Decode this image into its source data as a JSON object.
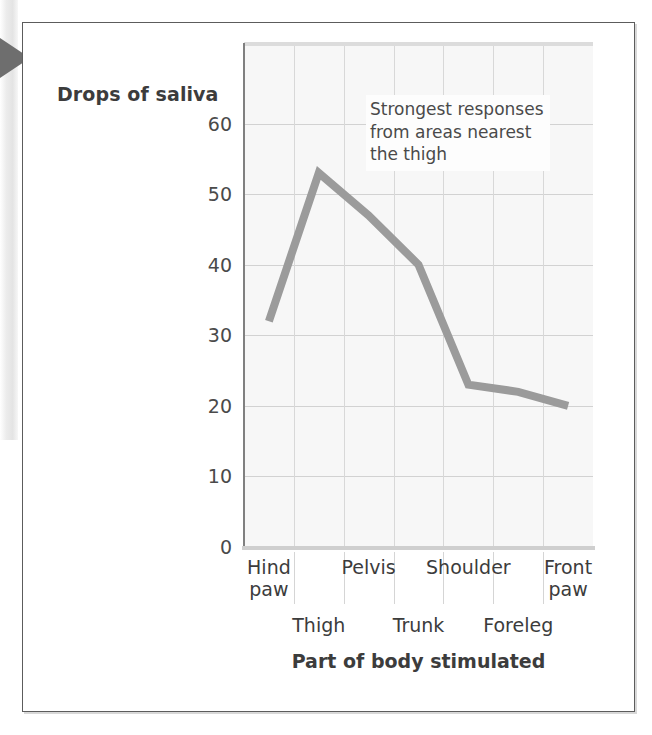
{
  "figure": {
    "y_axis_title": "Drops of saliva",
    "x_axis_title": "Part of body stimulated",
    "annotation": "Strongest responses\nfrom areas nearest\nthe thigh"
  },
  "chart_data": {
    "type": "line",
    "title": "",
    "xlabel": "Part of body stimulated",
    "ylabel": "Drops of saliva",
    "categories": [
      "Hind\npaw",
      "Thigh",
      "Pelvis",
      "Trunk",
      "Shoulder",
      "Foreleg",
      "Front\npaw"
    ],
    "category_rows": [
      0,
      1,
      0,
      1,
      0,
      1,
      0
    ],
    "values": [
      32,
      53,
      47,
      40,
      23,
      22,
      20
    ],
    "ylim": [
      0,
      71
    ],
    "yticks": [
      0,
      10,
      20,
      30,
      40,
      50,
      60
    ],
    "ytick_labels": [
      "0",
      "10",
      "20",
      "30",
      "40",
      "50",
      "60"
    ],
    "grid": true,
    "legend": "none",
    "annotations": [
      {
        "text": "Strongest responses\nfrom areas nearest\nthe thigh",
        "x_category": "Pelvis",
        "y_value": 66
      }
    ],
    "series_color": "#9b9b9b",
    "grid_color": "#d5d5d5",
    "plot_background": "#f7f7f7"
  },
  "colors": {
    "line": "#9b9b9b",
    "grid": "#d5d5d5",
    "axis": "#808080",
    "text": "#3c3c3c",
    "card_border": "#5c5c5c",
    "pointer": "#6e6e6e"
  }
}
